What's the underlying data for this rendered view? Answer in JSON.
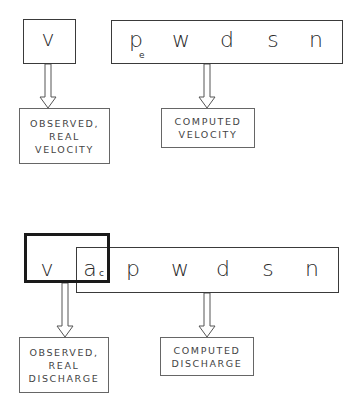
{
  "top": {
    "observed_var": "v",
    "computed_vars": [
      "p",
      "w",
      "d",
      "s",
      "n"
    ],
    "p_subscript": "e",
    "observed_label": [
      "OBSERVED,",
      "REAL",
      "VELOCITY"
    ],
    "computed_label": [
      "COMPUTED",
      "VELOCITY"
    ]
  },
  "bottom": {
    "observed_vars": [
      "v"
    ],
    "shared_var": "a",
    "shared_subscript": "c",
    "computed_vars": [
      "p",
      "w",
      "d",
      "s",
      "n"
    ],
    "observed_label": [
      "OBSERVED,",
      "REAL",
      "DISCHARGE"
    ],
    "computed_label": [
      "COMPUTED",
      "DISCHARGE"
    ]
  },
  "colors": {
    "line": "#3a3a3a",
    "thick_line": "#1a1a1a",
    "text": "#2a2a2a"
  }
}
